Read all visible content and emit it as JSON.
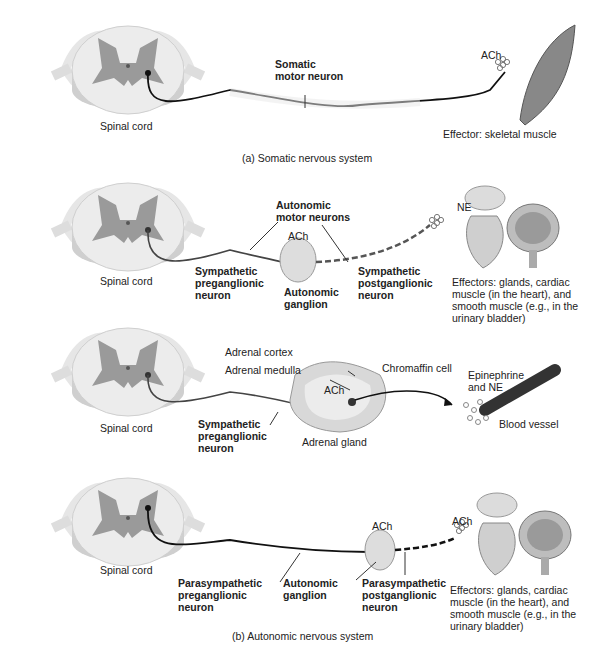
{
  "panel_a": {
    "caption": "(a) Somatic nervous system",
    "spinal_cord": "Spinal cord",
    "neuron": "Somatic motor neuron",
    "neuron_l1": "Somatic",
    "neuron_l2": "motor neuron",
    "transmitter": "ACh",
    "effector": "Effector: skeletal muscle"
  },
  "panel_b1": {
    "spinal_cord": "Spinal cord",
    "group_l1": "Autonomic",
    "group_l2": "motor neurons",
    "ganglion_transmitter": "ACh",
    "pre_l1": "Sympathetic",
    "pre_l2": "preganglionic",
    "pre_l3": "neuron",
    "ganglion_l1": "Autonomic",
    "ganglion_l2": "ganglion",
    "post_l1": "Sympathetic",
    "post_l2": "postganglionic",
    "post_l3": "neuron",
    "transmitter": "NE",
    "eff_l1": "Effectors: glands, cardiac",
    "eff_l2": "muscle (in the heart), and",
    "eff_l3": "smooth muscle (e.g., in the",
    "eff_l4": "urinary bladder)"
  },
  "panel_b2": {
    "spinal_cord": "Spinal cord",
    "cortex": "Adrenal cortex",
    "medulla": "Adrenal medulla",
    "chromaffin": "Chromaffin cell",
    "transmitter": "ACh",
    "pre_l1": "Sympathetic",
    "pre_l2": "preganglionic",
    "pre_l3": "neuron",
    "gland": "Adrenal gland",
    "release_l1": "Epinephrine",
    "release_l2": "and NE",
    "vessel": "Blood vessel"
  },
  "panel_b3": {
    "spinal_cord": "Spinal cord",
    "ganglion_transmitter": "ACh",
    "transmitter": "ACh",
    "pre_l1": "Parasympathetic",
    "pre_l2": "preganglionic",
    "pre_l3": "neuron",
    "ganglion_l1": "Autonomic",
    "ganglion_l2": "ganglion",
    "post_l1": "Parasympathetic",
    "post_l2": "postganglionic",
    "post_l3": "neuron",
    "eff_l1": "Effectors: glands, cardiac",
    "eff_l2": "muscle (in the heart), and",
    "eff_l3": "smooth muscle (e.g., in the",
    "eff_l4": "urinary bladder)"
  },
  "caption_b": "(b) Autonomic nervous system"
}
